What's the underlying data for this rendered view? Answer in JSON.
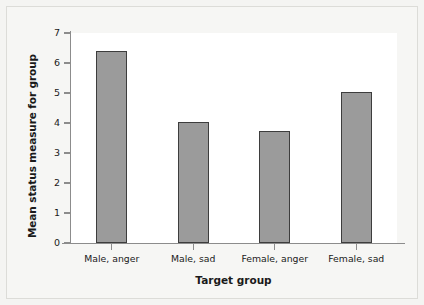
{
  "chart_data": {
    "type": "bar",
    "title": "",
    "subtitle": "",
    "xlabel": "Target group",
    "ylabel": "Mean status measure for group",
    "categories": [
      "Male, anger",
      "Male, sad",
      "Female, anger",
      "Female, sad"
    ],
    "values": [
      6.4,
      4.05,
      3.75,
      5.05
    ],
    "series": [
      {
        "name": "Mean status measure for group",
        "values": [
          6.4,
          4.05,
          3.75,
          5.05
        ]
      }
    ],
    "ylim": [
      0,
      7
    ],
    "yticks": [
      0,
      1,
      2,
      3,
      4,
      5,
      6,
      7
    ],
    "ytick_labels": [
      "0",
      "1",
      "2",
      "3",
      "4",
      "5",
      "6",
      "7"
    ],
    "xlim_note": "categorical, 4 groups evenly spaced",
    "grid": false,
    "legend": false,
    "legend_position": "none",
    "bar_color": "#9b9b9b",
    "bar_edge_color": "#3d3d3d",
    "plot_background": "#ffffff",
    "figure_background": "#f6f6f4",
    "axis_color": "#8c8c8c",
    "text_color": "#1a1a1a",
    "annotations": []
  }
}
